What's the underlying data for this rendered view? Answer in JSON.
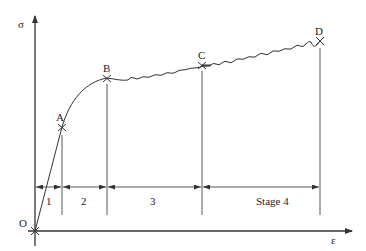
{
  "diagram": {
    "title": "",
    "axes": {
      "y_label": "σ",
      "x_label": "ε",
      "origin_label": "O"
    },
    "points": [
      {
        "label": "A"
      },
      {
        "label": "B"
      },
      {
        "label": "C"
      },
      {
        "label": "D"
      }
    ],
    "stages": [
      {
        "label": "1"
      },
      {
        "label": "2"
      },
      {
        "label": "3"
      },
      {
        "label": "Stage 4"
      }
    ]
  }
}
